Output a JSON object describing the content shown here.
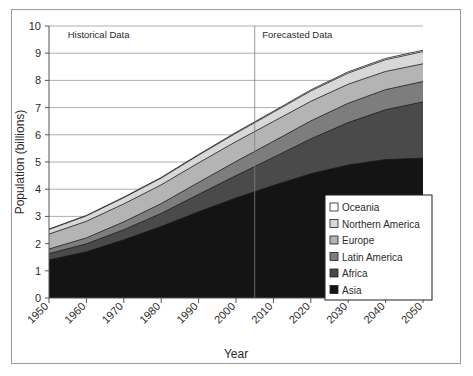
{
  "chart_data": {
    "type": "area",
    "stacked": true,
    "title": "",
    "xlabel": "Year",
    "ylabel": "Population (billions)",
    "xlim": [
      1950,
      2050
    ],
    "ylim": [
      0,
      10
    ],
    "ytick_step": 1,
    "grid": true,
    "legend_position": "inside-bottom-right",
    "x": [
      1950,
      1960,
      1970,
      1980,
      1990,
      2000,
      2010,
      2020,
      2030,
      2040,
      2050
    ],
    "categories": [
      "1950",
      "1960",
      "1970",
      "1980",
      "1990",
      "2000",
      "2010",
      "2020",
      "2030",
      "2040",
      "2050"
    ],
    "yticks": [
      "0",
      "1",
      "2",
      "3",
      "4",
      "5",
      "6",
      "7",
      "8",
      "9",
      "10"
    ],
    "series": [
      {
        "name": "Asia",
        "color": "#141414",
        "values": [
          1.4,
          1.7,
          2.14,
          2.63,
          3.17,
          3.68,
          4.14,
          4.57,
          4.89,
          5.09,
          5.14
        ]
      },
      {
        "name": "Africa",
        "color": "#4a4a4a",
        "values": [
          0.23,
          0.29,
          0.37,
          0.48,
          0.64,
          0.82,
          1.03,
          1.28,
          1.56,
          1.83,
          2.07
        ]
      },
      {
        "name": "Latin America",
        "color": "#7d7d7d",
        "values": [
          0.17,
          0.22,
          0.29,
          0.36,
          0.44,
          0.52,
          0.59,
          0.66,
          0.71,
          0.74,
          0.75
        ]
      },
      {
        "name": "Europe",
        "color": "#b4b4b4",
        "values": [
          0.55,
          0.61,
          0.66,
          0.69,
          0.72,
          0.73,
          0.73,
          0.72,
          0.7,
          0.67,
          0.65
        ]
      },
      {
        "name": "Northern America",
        "color": "#d8d8d8",
        "values": [
          0.17,
          0.2,
          0.23,
          0.25,
          0.28,
          0.31,
          0.34,
          0.38,
          0.41,
          0.43,
          0.45
        ]
      },
      {
        "name": "Oceania",
        "color": "#ffffff",
        "values": [
          0.013,
          0.016,
          0.019,
          0.023,
          0.027,
          0.031,
          0.036,
          0.041,
          0.045,
          0.048,
          0.05
        ]
      }
    ],
    "totals": [
      2.53,
      3.04,
      3.71,
      4.43,
      5.28,
      6.09,
      6.87,
      7.65,
      8.32,
      8.81,
      9.11
    ],
    "annotations": [
      {
        "text": "Historical Data",
        "x": 1955,
        "y": 9.55,
        "align": "left"
      },
      {
        "text": "Forecasted Data",
        "x": 2007,
        "y": 9.55,
        "align": "left"
      }
    ],
    "divider": {
      "x": 2005,
      "label": "forecast-start"
    }
  },
  "legend": {
    "items": [
      {
        "label": "Oceania",
        "color": "#ffffff"
      },
      {
        "label": "Northern America",
        "color": "#d8d8d8"
      },
      {
        "label": "Europe",
        "color": "#b4b4b4"
      },
      {
        "label": "Latin America",
        "color": "#7d7d7d"
      },
      {
        "label": "Africa",
        "color": "#4a4a4a"
      },
      {
        "label": "Asia",
        "color": "#141414"
      }
    ]
  }
}
